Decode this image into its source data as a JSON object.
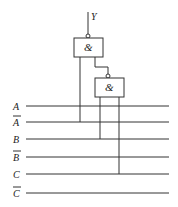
{
  "diagram": {
    "output_label": "Y",
    "gates": [
      {
        "id": "gate1",
        "symbol": "&",
        "inverted_output": true
      },
      {
        "id": "gate2",
        "symbol": "&",
        "inverted_output": true
      }
    ],
    "inputs": [
      {
        "label": "A",
        "bar": false
      },
      {
        "label": "A",
        "bar": true
      },
      {
        "label": "B",
        "bar": false
      },
      {
        "label": "B",
        "bar": true
      },
      {
        "label": "C",
        "bar": false
      },
      {
        "label": "C",
        "bar": true
      }
    ],
    "connections": [
      {
        "from": "A-bar",
        "to": "gate1"
      },
      {
        "from": "gate2",
        "to": "gate1"
      },
      {
        "from": "B",
        "to": "gate2"
      },
      {
        "from": "C",
        "to": "gate2"
      }
    ]
  }
}
